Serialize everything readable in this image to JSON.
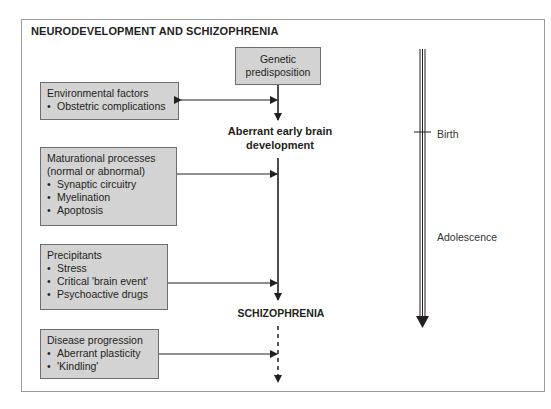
{
  "diagram": {
    "title": "NEURODEVELOPMENT AND SCHIZOPHRENIA",
    "nodes": {
      "genetic": {
        "lines": [
          "Genetic",
          "predisposition"
        ]
      },
      "environmental": {
        "heading": "Environmental factors",
        "items": [
          "Obstetric complications"
        ]
      },
      "aberrant": {
        "lines": [
          "Aberrant early brain",
          "development"
        ]
      },
      "maturational": {
        "heading_lines": [
          "Maturational processes",
          "(normal or abnormal)"
        ],
        "items": [
          "Synaptic circuitry",
          "Myelination",
          "Apoptosis"
        ]
      },
      "precipitants": {
        "heading": "Precipitants",
        "items": [
          "Stress",
          "Critical 'brain event'",
          "Psychoactive drugs"
        ]
      },
      "schizophrenia": {
        "label": "SCHIZOPHRENIA"
      },
      "progression": {
        "heading": "Disease progression",
        "items": [
          "Aberrant plasticity",
          "'Kindling'"
        ]
      }
    },
    "timeline": {
      "markers": [
        "Birth",
        "Adolescence"
      ]
    },
    "colors": {
      "box_fill": "#d3d3d3",
      "box_border": "#6e6e6e",
      "line": "#231f20",
      "frame": "#9a9a9a"
    }
  }
}
